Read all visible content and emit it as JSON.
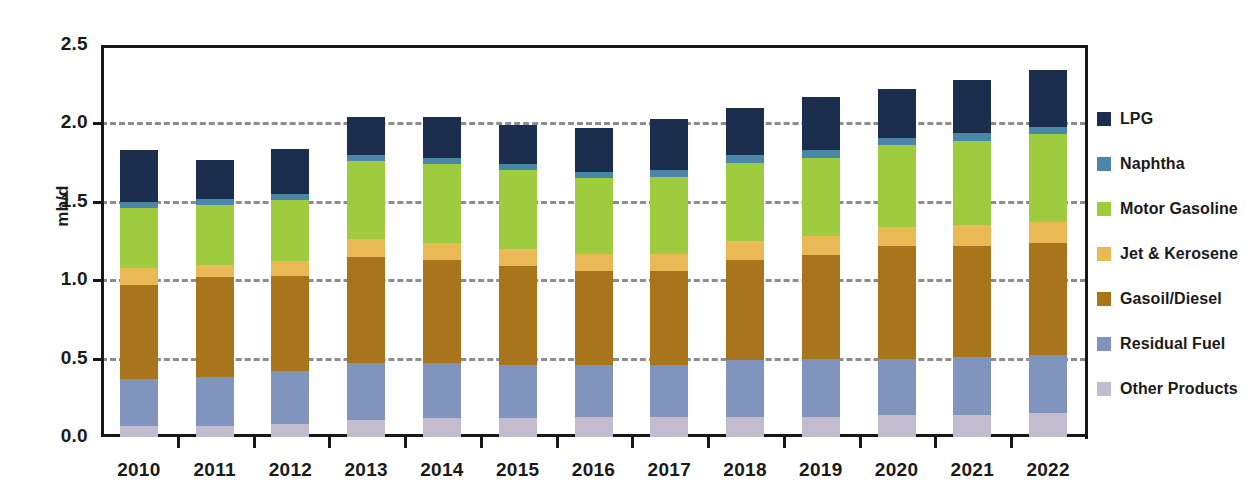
{
  "chart_data": {
    "type": "bar",
    "stacked": true,
    "title": "",
    "xlabel": "",
    "ylabel": "mb/d",
    "ylim": [
      0.0,
      2.5
    ],
    "ytick_labels": [
      "0.0",
      "0.5",
      "1.0",
      "1.5",
      "2.0",
      "2.5"
    ],
    "ytick_values": [
      0.0,
      0.5,
      1.0,
      1.5,
      2.0,
      2.5
    ],
    "grid": "horizontal-dashed",
    "gridline_values": [
      0.5,
      1.0,
      1.5,
      2.0
    ],
    "legend_position": "right",
    "categories": [
      "2010",
      "2011",
      "2012",
      "2013",
      "2014",
      "2015",
      "2016",
      "2017",
      "2018",
      "2019",
      "2020",
      "2021",
      "2022"
    ],
    "series": [
      {
        "name": "Other Products",
        "color": "#c3bcce",
        "values": [
          0.07,
          0.07,
          0.08,
          0.11,
          0.12,
          0.12,
          0.13,
          0.13,
          0.13,
          0.13,
          0.14,
          0.14,
          0.15
        ]
      },
      {
        "name": "Residual Fuel",
        "color": "#8094be",
        "values": [
          0.3,
          0.31,
          0.34,
          0.36,
          0.35,
          0.34,
          0.33,
          0.33,
          0.36,
          0.37,
          0.36,
          0.37,
          0.37
        ]
      },
      {
        "name": "Gasoil/Diesel",
        "color": "#a8741c",
        "values": [
          0.6,
          0.64,
          0.61,
          0.68,
          0.66,
          0.63,
          0.6,
          0.6,
          0.64,
          0.66,
          0.72,
          0.71,
          0.72
        ]
      },
      {
        "name": "Jet & Kerosene",
        "color": "#e8b955",
        "values": [
          0.11,
          0.08,
          0.09,
          0.11,
          0.11,
          0.11,
          0.11,
          0.11,
          0.12,
          0.12,
          0.12,
          0.13,
          0.13
        ]
      },
      {
        "name": "Motor Gasoline",
        "color": "#9fcb3e",
        "values": [
          0.38,
          0.38,
          0.39,
          0.5,
          0.5,
          0.5,
          0.48,
          0.49,
          0.5,
          0.5,
          0.52,
          0.54,
          0.56
        ]
      },
      {
        "name": "Naphtha",
        "color": "#4a86a8",
        "values": [
          0.04,
          0.04,
          0.04,
          0.04,
          0.04,
          0.04,
          0.04,
          0.04,
          0.05,
          0.05,
          0.05,
          0.05,
          0.05
        ]
      },
      {
        "name": "LPG",
        "color": "#1c2e4e",
        "values": [
          0.33,
          0.25,
          0.29,
          0.24,
          0.26,
          0.25,
          0.28,
          0.33,
          0.3,
          0.34,
          0.31,
          0.34,
          0.36
        ]
      }
    ],
    "totals": [
      1.83,
      1.77,
      1.84,
      2.04,
      2.04,
      1.99,
      1.97,
      2.03,
      2.1,
      2.17,
      2.22,
      2.28,
      2.34
    ]
  },
  "legend": {
    "items": [
      {
        "label": "LPG",
        "color": "#1c2e4e"
      },
      {
        "label": "Naphtha",
        "color": "#4a86a8"
      },
      {
        "label": "Motor Gasoline",
        "color": "#9fcb3e"
      },
      {
        "label": "Jet & Kerosene",
        "color": "#e8b955"
      },
      {
        "label": "Gasoil/Diesel",
        "color": "#a8741c"
      },
      {
        "label": "Residual Fuel",
        "color": "#8094be"
      },
      {
        "label": "Other Products",
        "color": "#c3bcce"
      }
    ]
  },
  "axes": {
    "y_title": "mb/d"
  },
  "colors": {
    "axis": "#171717",
    "gridline": "#8d8d8d",
    "background": "#ffffff"
  }
}
